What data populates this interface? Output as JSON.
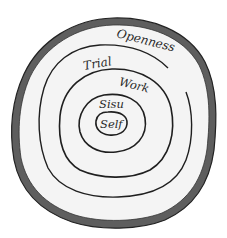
{
  "diagram": {
    "type": "concentric-tree-rings",
    "colors": {
      "background": "#ffffff",
      "wood": "#f4f4f4",
      "bark": "#5e5e5e",
      "ring_line": "#1f1f1f",
      "label": "#2a2a2a"
    },
    "rings": [
      {
        "id": "openness",
        "label": "Openness",
        "order": 1
      },
      {
        "id": "trial",
        "label": "Trial",
        "order": 2
      },
      {
        "id": "work",
        "label": "Work",
        "order": 3
      },
      {
        "id": "sisu",
        "label": "Sisu",
        "order": 4
      },
      {
        "id": "self",
        "label": "Self",
        "order": 5
      }
    ]
  }
}
